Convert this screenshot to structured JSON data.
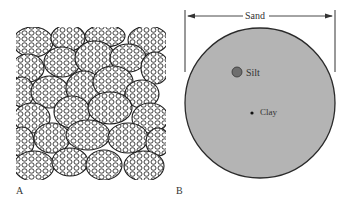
{
  "figure": {
    "panel_a": {
      "label": "A",
      "description": "Packed sand grains composed of aggregated particles"
    },
    "panel_b": {
      "label": "B",
      "scale_label": "Sand",
      "particles": [
        {
          "name": "Silt",
          "label": "Silt"
        },
        {
          "name": "Clay",
          "label": "Clay"
        }
      ]
    },
    "colors": {
      "sand_fill": "#b4b4b4",
      "outline": "#2a2a2a",
      "silt_fill": "#6e6e6e",
      "clay_fill": "#111111",
      "text": "#333333"
    }
  }
}
